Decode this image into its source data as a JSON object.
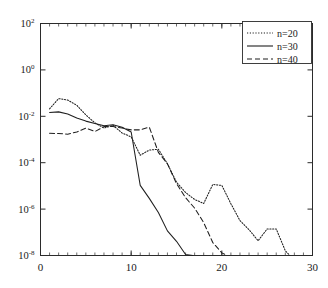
{
  "chart_data": {
    "type": "line",
    "title": "",
    "xlabel": "",
    "ylabel": "",
    "xlim": [
      0,
      30
    ],
    "ylim": [
      1e-08,
      100.0
    ],
    "yscale": "log",
    "xscale": "linear",
    "grid": false,
    "xticks": [
      0,
      10,
      20,
      30
    ],
    "xtick_labels": [
      "0",
      "10",
      "20",
      "30"
    ],
    "x_minor_tick_step": 1,
    "yticks": [
      100,
      1,
      0.01,
      0.0001,
      1e-06,
      1e-08
    ],
    "ytick_labels": [
      "10²",
      "10⁰",
      "10⁻²",
      "10⁻⁴",
      "10⁻⁶",
      "10⁻⁸"
    ],
    "ytick_mantissa": [
      "10",
      "10",
      "10",
      "10",
      "10",
      "10"
    ],
    "ytick_exponents": [
      "2",
      "0",
      "-2",
      "-4",
      "-6",
      "-8"
    ],
    "legend_position": "upper right",
    "series": [
      {
        "name": "n=20",
        "style": "dotted",
        "color": "#1f1f1f",
        "x": [
          1,
          2,
          3,
          4,
          5,
          6,
          7,
          8,
          9,
          10,
          11,
          12,
          13,
          14,
          15,
          16,
          17,
          18,
          19,
          20,
          21,
          22,
          23,
          24,
          25,
          26,
          27,
          27.5
        ],
        "y": [
          0.021,
          0.058,
          0.05,
          0.03,
          0.0115,
          0.0052,
          0.0031,
          0.0041,
          0.0019,
          0.0013,
          0.00021,
          0.00035,
          0.00038,
          9e-05,
          1.45e-05,
          5.2e-06,
          2.6e-06,
          1.75e-06,
          1.15e-05,
          1.05e-05,
          1.7e-06,
          3.2e-07,
          1.3e-07,
          4.3e-08,
          1.4e-07,
          1.4e-07,
          1.6e-08,
          1e-08
        ]
      },
      {
        "name": "n=30",
        "style": "solid",
        "color": "#1f1f1f",
        "x": [
          1,
          2,
          3,
          4,
          5,
          6,
          7,
          8,
          9,
          10,
          11,
          12,
          13,
          14,
          15,
          16,
          16.8
        ],
        "y": [
          0.0145,
          0.0155,
          0.0125,
          0.0085,
          0.0062,
          0.0049,
          0.0039,
          0.0043,
          0.0034,
          0.0021,
          1.05e-05,
          2.9e-06,
          7.2e-07,
          1.15e-07,
          4.1e-08,
          1.1e-08,
          1e-08
        ]
      },
      {
        "name": "n=40",
        "style": "dashed",
        "color": "#1f1f1f",
        "x": [
          1,
          2,
          3,
          4,
          5,
          6,
          7,
          8,
          9,
          10,
          11,
          12,
          13,
          14,
          15,
          16,
          17,
          18,
          19,
          20,
          20.6
        ],
        "y": [
          0.00185,
          0.0018,
          0.0017,
          0.0021,
          0.0031,
          0.0022,
          0.0036,
          0.0036,
          0.0031,
          0.0026,
          0.0026,
          0.0034,
          0.00028,
          9e-05,
          1.25e-05,
          3.1e-06,
          1.1e-06,
          2.6e-07,
          3.6e-08,
          1.3e-08,
          1e-08
        ]
      }
    ],
    "legend_entries": [
      {
        "label": "n=20",
        "style": "dotted"
      },
      {
        "label": "n=30",
        "style": "solid"
      },
      {
        "label": "n=40",
        "style": "dashed"
      }
    ]
  }
}
